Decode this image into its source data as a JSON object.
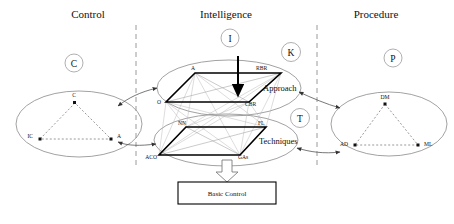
{
  "figure": {
    "background": "#ffffff",
    "accent": "#000000"
  },
  "headers": [
    {
      "label": "Control",
      "x": 88,
      "y": 18
    },
    {
      "label": "Intelligence",
      "x": 226,
      "y": 18
    },
    {
      "label": "Procedure",
      "x": 376,
      "y": 18
    }
  ],
  "badges": [
    {
      "letter": "C",
      "cx": 74,
      "cy": 63,
      "r": 9
    },
    {
      "letter": "I",
      "cx": 230,
      "cy": 38,
      "r": 9
    },
    {
      "letter": "K",
      "cx": 291,
      "cy": 52,
      "r": 9.5
    },
    {
      "letter": "T",
      "cx": 300,
      "cy": 118,
      "r": 9.5
    },
    {
      "letter": "P",
      "cx": 393,
      "cy": 58,
      "r": 9
    }
  ],
  "dividers": [
    {
      "name": "divider-control-intelligence",
      "x": 136,
      "y1": 25,
      "y2": 168
    },
    {
      "name": "divider-intelligence-procedure",
      "x": 317,
      "y1": 25,
      "y2": 168
    }
  ],
  "ellipses": [
    {
      "name": "control-ellipse",
      "cx": 79,
      "cy": 124,
      "rx": 63,
      "ry": 33,
      "nodes": [
        {
          "label": "C",
          "x": 75,
          "y": 103,
          "lx": 74,
          "ly": 97,
          "anchor": "middle"
        },
        {
          "label": "IC",
          "x": 40,
          "y": 139,
          "lx": 33,
          "ly": 138,
          "anchor": "end"
        },
        {
          "label": "A",
          "x": 111,
          "y": 139,
          "lx": 117,
          "ly": 138,
          "anchor": "start"
        }
      ]
    },
    {
      "name": "procedure-ellipse",
      "cx": 389,
      "cy": 124,
      "rx": 58,
      "ry": 32,
      "nodes": [
        {
          "label": "DM",
          "x": 385,
          "y": 104,
          "lx": 385,
          "ly": 99,
          "anchor": "middle"
        },
        {
          "label": "AD",
          "x": 355,
          "y": 145,
          "lx": 348,
          "ly": 145,
          "anchor": "end"
        },
        {
          "label": "ML",
          "x": 418,
          "y": 145,
          "lx": 424,
          "ly": 145,
          "anchor": "start"
        }
      ]
    }
  ],
  "layers": [
    {
      "name": "approach-layer",
      "group_label": "Approach",
      "group_label_x": 263,
      "group_label_y": 91,
      "ellipse": {
        "cx": 229,
        "cy": 88,
        "rx": 72,
        "ry": 28
      },
      "nodes": [
        {
          "label": "A",
          "x": 195,
          "y": 73,
          "lx": 193,
          "ly": 70,
          "anchor": "middle"
        },
        {
          "label": "RBR",
          "x": 281,
          "y": 73,
          "lx": 256,
          "ly": 70,
          "anchor": "start"
        },
        {
          "label": "O",
          "x": 166,
          "y": 102,
          "lx": 161,
          "ly": 104,
          "anchor": "end"
        },
        {
          "label": "CBR",
          "x": 249,
          "y": 102,
          "lx": 245,
          "ly": 106,
          "anchor": "start"
        }
      ]
    },
    {
      "name": "techniques-layer",
      "group_label": "Techniques",
      "group_label_x": 259,
      "group_label_y": 144,
      "ellipse": {
        "cx": 226,
        "cy": 140,
        "rx": 72,
        "ry": 26
      },
      "nodes": [
        {
          "label": "NN",
          "x": 186,
          "y": 127,
          "lx": 182,
          "ly": 125,
          "anchor": "middle"
        },
        {
          "label": "FL",
          "x": 266,
          "y": 127,
          "lx": 258,
          "ly": 125,
          "anchor": "start"
        },
        {
          "label": "ACO",
          "x": 159,
          "y": 155,
          "lx": 157,
          "ly": 159,
          "anchor": "end"
        },
        {
          "label": "GAs",
          "x": 240,
          "y": 155,
          "lx": 238,
          "ly": 159,
          "anchor": "start"
        }
      ]
    }
  ],
  "bottom_box": {
    "label": "Basic Control",
    "x": 178,
    "y": 182,
    "width": 98,
    "height": 22
  },
  "arrows": {
    "down_arrow_label": "input-arrow",
    "hollow_arrow_label": "hollow-down-arrow"
  }
}
